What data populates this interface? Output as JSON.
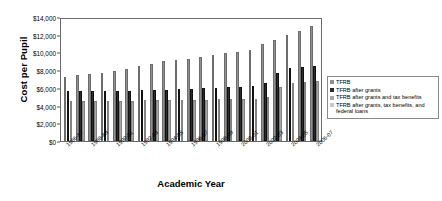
{
  "chart_data": {
    "type": "bar",
    "title": "",
    "xlabel": "Academic Year",
    "ylabel": "Cost per Pupil",
    "ylim": [
      0,
      14000
    ],
    "ytick_labels": [
      "$14,000",
      "$12,000",
      "$10,000",
      "$8,000",
      "$6,000",
      "$4,000",
      "$2,000",
      "$0"
    ],
    "ytick_values": [
      14000,
      12000,
      10000,
      8000,
      6000,
      4000,
      2000,
      0
    ],
    "grid": false,
    "legend_position": "right",
    "categories": [
      "1986-87",
      "1987-88",
      "1988-89",
      "1989-90",
      "1990-91",
      "1991-92",
      "1992-93",
      "1993-94",
      "1994-95",
      "1995-96",
      "1996-97",
      "1997-98",
      "1998-99",
      "1999-00",
      "2000-01",
      "2001-02",
      "2002-03",
      "2003-04",
      "2004-05",
      "2005-06",
      "2006-07"
    ],
    "tick_labels_shown": [
      "1986-87",
      "1988-89",
      "1990-91",
      "1992-93",
      "1994-95",
      "1996-97",
      "1998-99",
      "2000-01",
      "2002-03",
      "2004-05",
      "2006-07"
    ],
    "series": [
      {
        "name": "TFRB",
        "color": "#8f8f8f",
        "values": [
          7200,
          7400,
          7600,
          7700,
          7900,
          8100,
          8450,
          8700,
          9000,
          9100,
          9300,
          9500,
          9700,
          9900,
          10000,
          10300,
          10900,
          11400,
          12000,
          12400,
          13000
        ]
      },
      {
        "name": "TFRB after grants",
        "color": "#2b2b2b",
        "values": [
          5600,
          5650,
          5700,
          5700,
          5700,
          5700,
          5750,
          5800,
          5800,
          5850,
          5900,
          5950,
          6000,
          6050,
          6100,
          6200,
          6500,
          7700,
          8300,
          8400,
          8500
        ]
      },
      {
        "name": "TFRB after grants and tax benefits",
        "color": "#a8a8a8",
        "values": [
          4500,
          4520,
          4550,
          4550,
          4560,
          4560,
          4580,
          4600,
          4600,
          4620,
          4650,
          4680,
          4700,
          4720,
          4750,
          4800,
          5000,
          6100,
          6600,
          6700,
          6800
        ]
      },
      {
        "name": "TFRB after grants, tax benefits, and federal loans",
        "color": "#c9c9c9",
        "values": [
          null,
          null,
          null,
          null,
          null,
          null,
          null,
          null,
          null,
          null,
          null,
          null,
          null,
          null,
          null,
          null,
          null,
          null,
          null,
          null,
          null
        ]
      }
    ]
  },
  "legend": {
    "items": [
      {
        "label": "TFRB",
        "color": "#8f8f8f"
      },
      {
        "label": "TFRB after grants",
        "color": "#2b2b2b"
      },
      {
        "label": "TFRB after grants and tax benefits",
        "color": "#a8a8a8"
      },
      {
        "label": "TFRB after grants, tax benefits, and federal loans",
        "color": "#c9c9c9"
      }
    ]
  }
}
